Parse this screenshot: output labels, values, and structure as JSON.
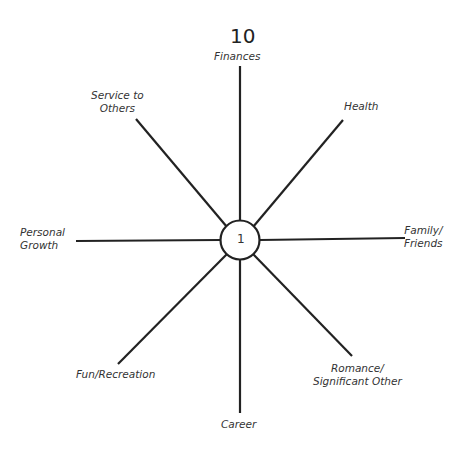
{
  "wheel": {
    "scale_max": "10",
    "center_value": "1",
    "spokes": [
      {
        "label": "Finances"
      },
      {
        "label": "Health"
      },
      {
        "label": "Family/ Friends",
        "line1": "Family/",
        "line2": "Friends"
      },
      {
        "label": "Romance/ Significant Other",
        "line1": "Romance/",
        "line2": "Significant Other"
      },
      {
        "label": "Career"
      },
      {
        "label": "Fun/Recreation"
      },
      {
        "label": "Personal Growth",
        "line1": "Personal",
        "line2": "Growth"
      },
      {
        "label": "Service to Others",
        "line1": "Service to",
        "line2": "Others"
      }
    ]
  }
}
